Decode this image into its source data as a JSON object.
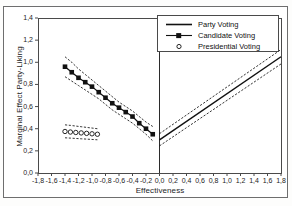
{
  "figure": {
    "clipped_top_text": "",
    "frame_color": "#6e6e6e",
    "background": "#ffffff"
  },
  "legend": {
    "position": "top-right",
    "entries": [
      {
        "label": "Party Voting",
        "symbol": "solid-line",
        "marker": "none"
      },
      {
        "label": "Candidate Voting",
        "symbol": "line-with-marker",
        "marker": "filled-square"
      },
      {
        "label": "Presidential Voting",
        "symbol": "marker-only",
        "marker": "open-circle"
      }
    ]
  },
  "chart_data": {
    "type": "line",
    "title": "",
    "subtitle": "",
    "xlabel": "Effectiveness",
    "ylabel": "Marginal Effect Party-Liking",
    "xlim": [
      -1.8,
      1.8
    ],
    "ylim": [
      0.0,
      1.4
    ],
    "xticks": [
      -1.8,
      -1.6,
      -1.4,
      -1.2,
      -1.0,
      -0.8,
      -0.6,
      -0.4,
      -0.2,
      0.0,
      0.2,
      0.4,
      0.6,
      0.8,
      1.0,
      1.2,
      1.4,
      1.6,
      1.8
    ],
    "yticks": [
      0.0,
      0.2,
      0.4,
      0.6,
      0.8,
      1.0,
      1.2,
      1.4
    ],
    "xticklabels": [
      "-1,8",
      "-1,6",
      "-1,4",
      "-1,2",
      "-1,0",
      "-0,8",
      "-0,6",
      "-0,4",
      "-0,2",
      "0,0",
      "0,2",
      "0,4",
      "0,6",
      "0,8",
      "1,0",
      "1,2",
      "1,4",
      "1,6",
      "1,8"
    ],
    "yticklabels": [
      "0,0",
      "0,2",
      "0,4",
      "0,6",
      "0,8",
      "1,0",
      "1,2",
      "1,4"
    ],
    "grid": false,
    "legend_position": "upper right",
    "decimal_separator": ",",
    "annotations": [
      {
        "kind": "vertical-reference-line",
        "x": 0.0,
        "style": "solid",
        "color": "#2b2b2b"
      }
    ],
    "series": [
      {
        "name": "Candidate Voting",
        "style": "line-with-markers",
        "marker": "filled-square",
        "color": "#111111",
        "x": [
          -1.4,
          -1.3,
          -1.2,
          -1.1,
          -1.0,
          -0.9,
          -0.8,
          -0.7,
          -0.6,
          -0.5,
          -0.4,
          -0.3,
          -0.2,
          -0.1
        ],
        "values": [
          0.96,
          0.91,
          0.86,
          0.82,
          0.78,
          0.73,
          0.68,
          0.63,
          0.59,
          0.55,
          0.51,
          0.45,
          0.4,
          0.35
        ],
        "ci_upper": [
          1.05,
          1.0,
          0.94,
          0.89,
          0.84,
          0.79,
          0.74,
          0.69,
          0.64,
          0.6,
          0.56,
          0.51,
          0.46,
          0.42
        ],
        "ci_lower": [
          0.87,
          0.83,
          0.79,
          0.75,
          0.71,
          0.67,
          0.62,
          0.57,
          0.53,
          0.49,
          0.45,
          0.4,
          0.35,
          0.29
        ],
        "ci_style": "dashed"
      },
      {
        "name": "Presidential Voting",
        "style": "markers-only",
        "marker": "open-circle",
        "color": "#111111",
        "x": [
          -1.4,
          -1.32,
          -1.24,
          -1.16,
          -1.08,
          -1.0,
          -0.92
        ],
        "values": [
          0.375,
          0.37,
          0.366,
          0.362,
          0.358,
          0.354,
          0.35
        ],
        "ci_upper": [
          0.435,
          0.43,
          0.424,
          0.418,
          0.412,
          0.406,
          0.4
        ],
        "ci_lower": [
          0.318,
          0.315,
          0.312,
          0.309,
          0.306,
          0.303,
          0.3
        ],
        "ci_style": "dashed"
      },
      {
        "name": "Party Voting",
        "style": "solid-line",
        "marker": "none",
        "color": "#111111",
        "x": [
          0.0,
          1.8
        ],
        "values": [
          0.3,
          1.05
        ],
        "ci_upper": [
          0.355,
          1.115
        ],
        "ci_lower": [
          0.245,
          0.985
        ],
        "ci_style": "dashed"
      }
    ]
  }
}
